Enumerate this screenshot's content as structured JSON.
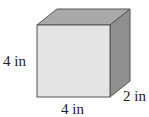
{
  "figure": {
    "type": "rectangular-prism",
    "dimensions": {
      "height": {
        "value": 4,
        "unit": "in",
        "label": "4 in"
      },
      "width": {
        "value": 4,
        "unit": "in",
        "label": "4 in"
      },
      "depth": {
        "value": 2,
        "unit": "in",
        "label": "2 in"
      }
    },
    "colors": {
      "front_face": "#e3e3e3",
      "top_face": "#a9a9a9",
      "side_face": "#8f8f8f",
      "edge": "#555555",
      "text": "#222222"
    }
  }
}
